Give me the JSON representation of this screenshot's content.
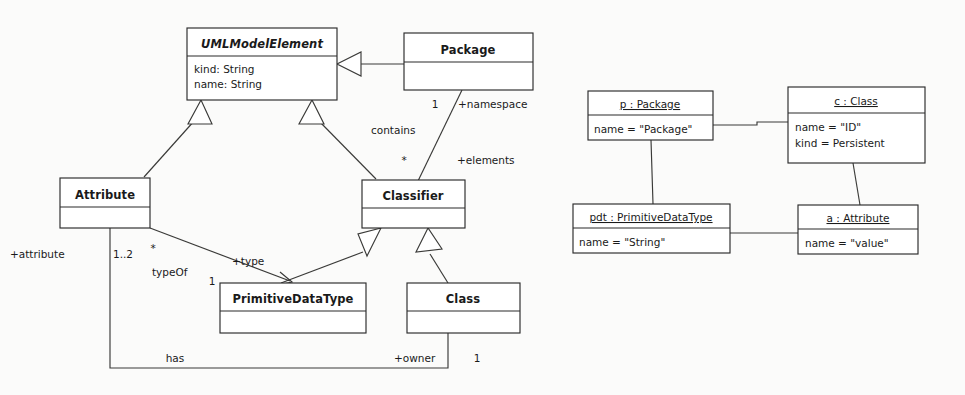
{
  "diagram": {
    "kind": "uml-class-and-object-diagram",
    "background_color": "#fbfbfa",
    "line_color": "#3a3a38",
    "box_fill": "#ffffff"
  },
  "class_diagram": {
    "classes": [
      {
        "id": "umlmodelelement",
        "name": "UMLModelElement",
        "abstract": true,
        "attributes": [
          "kind: String",
          "name: String"
        ],
        "x": 187,
        "y": 28,
        "w": 150,
        "h": 72,
        "title_h": 28
      },
      {
        "id": "package",
        "name": "Package",
        "abstract": false,
        "attributes": [],
        "x": 404,
        "y": 33,
        "w": 129,
        "h": 57,
        "title_h": 29
      },
      {
        "id": "attribute",
        "name": "Attribute",
        "abstract": false,
        "attributes": [],
        "x": 60,
        "y": 178,
        "w": 90,
        "h": 50,
        "title_h": 29
      },
      {
        "id": "classifier",
        "name": "Classifier",
        "abstract": false,
        "attributes": [],
        "x": 362,
        "y": 180,
        "w": 103,
        "h": 48,
        "title_h": 28
      },
      {
        "id": "primitivedatatype",
        "name": "PrimitiveDataType",
        "abstract": false,
        "attributes": [],
        "x": 220,
        "y": 283,
        "w": 146,
        "h": 50,
        "title_h": 28
      },
      {
        "id": "class",
        "name": "Class",
        "abstract": false,
        "attributes": [],
        "x": 407,
        "y": 283,
        "w": 113,
        "h": 50,
        "title_h": 28
      }
    ],
    "edge_labels": [
      {
        "id": "namespace-mult",
        "text": "1",
        "x": 435,
        "y": 108
      },
      {
        "id": "namespace-role",
        "text": "+namespace",
        "x": 503,
        "y": 108
      },
      {
        "id": "contains-name",
        "text": "contains",
        "x": 400,
        "y": 134
      },
      {
        "id": "elements-mult",
        "text": "*",
        "x": 404,
        "y": 164
      },
      {
        "id": "elements-role",
        "text": "+elements",
        "x": 494,
        "y": 162
      },
      {
        "id": "attribute-role",
        "text": "+attribute",
        "x": 53,
        "y": 254
      },
      {
        "id": "attribute-mult",
        "text": "1..2",
        "x": 126,
        "y": 254
      },
      {
        "id": "typeof-mult-star",
        "text": "*",
        "x": 153,
        "y": 248
      },
      {
        "id": "typeof-name",
        "text": "typeOf",
        "x": 180,
        "y": 272
      },
      {
        "id": "type-role",
        "text": "+type",
        "x": 258,
        "y": 262
      },
      {
        "id": "type-mult",
        "text": "1",
        "x": 212,
        "y": 283
      },
      {
        "id": "has-name",
        "text": "has",
        "x": 175,
        "y": 362
      },
      {
        "id": "owner-role",
        "text": "+owner",
        "x": 422,
        "y": 362
      },
      {
        "id": "owner-mult",
        "text": "1",
        "x": 477,
        "y": 362
      }
    ]
  },
  "object_diagram": {
    "objects": [
      {
        "id": "p-package",
        "title": "p : Package",
        "slots": [
          "name = \"Package\""
        ],
        "x": 588,
        "y": 91,
        "w": 125,
        "h": 49,
        "title_h": 24
      },
      {
        "id": "c-class",
        "title": "c : Class",
        "slots": [
          "name = \"ID\"",
          "kind = Persistent"
        ],
        "x": 788,
        "y": 87,
        "w": 137,
        "h": 76,
        "title_h": 26
      },
      {
        "id": "pdt-primitivedatatype",
        "title": "pdt : PrimitiveDataType",
        "slots": [
          "name = \"String\""
        ],
        "x": 573,
        "y": 204,
        "w": 157,
        "h": 49,
        "title_h": 24
      },
      {
        "id": "a-attribute",
        "title": "a : Attribute",
        "slots": [
          "name = \"value\""
        ],
        "x": 798,
        "y": 205,
        "w": 120,
        "h": 49,
        "title_h": 24
      }
    ]
  }
}
